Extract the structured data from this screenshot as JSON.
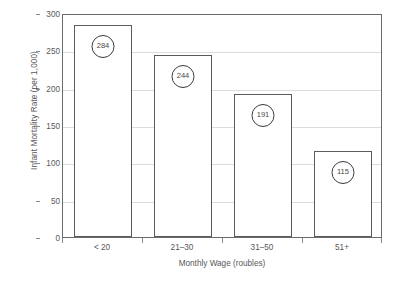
{
  "chart_data": {
    "type": "bar",
    "title": "",
    "subtitle": "",
    "xlabel": "Monthly Wage (roubles)",
    "ylabel": "Infant Mortality Rate (per 1,000)",
    "categories": [
      "< 20",
      "21–30",
      "31–50",
      "51+"
    ],
    "values": [
      284,
      244,
      191,
      115
    ],
    "data_labels": [
      "284",
      "244",
      "191",
      "115"
    ],
    "ylim": [
      0,
      300
    ],
    "ytick_labels": [
      "0",
      "50",
      "100",
      "150",
      "200",
      "250",
      "300"
    ],
    "ytick_values": [
      0,
      50,
      100,
      150,
      200,
      250,
      300
    ],
    "grid": "horizontal",
    "legend": "none",
    "annotations": "Each bar's value is printed inside a circular badge near the top of the bar.",
    "colors": {
      "bar_fill": "#ffffff",
      "bar_stroke": "#5c5c5c",
      "gridline": "#dcdcdc",
      "axis": "#6b6b6b",
      "text": "#58585a",
      "badge_stroke": "#3a3a3a",
      "background": "#ffffff"
    }
  }
}
